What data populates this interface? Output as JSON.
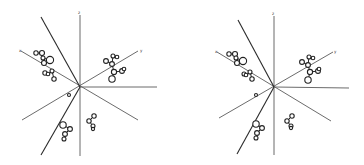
{
  "figure": {
    "type": "stereo-pair",
    "panels": [
      {
        "id": "left",
        "offset_x": 0,
        "center": [
          80,
          87
        ],
        "axes": [
          {
            "name": "z",
            "from": [
              80,
              87
            ],
            "to": [
              80,
              15
            ],
            "label_at": [
              78,
              14
            ]
          },
          {
            "name": "z-neg",
            "from": [
              80,
              87
            ],
            "to": [
              80,
              156
            ]
          },
          {
            "name": "x",
            "from": [
              21,
              51
            ],
            "to": [
              138,
              120
            ],
            "label_at": [
              19,
              52
            ]
          },
          {
            "name": "y",
            "from": [
              138,
              51
            ],
            "to": [
              22,
              120
            ],
            "label_at": [
              140,
              52
            ]
          },
          {
            "name": "steep-a",
            "from": [
              41,
              17
            ],
            "to": [
              80,
              87
            ]
          },
          {
            "name": "steep-b",
            "from": [
              80,
              87
            ],
            "to": [
              41,
              155
            ]
          },
          {
            "name": "horizontal",
            "from": [
              80,
              87
            ],
            "to": [
              157,
              87
            ]
          }
        ],
        "label_glyphs": {
          "top": "z",
          "left": "x",
          "right": "y"
        },
        "molecules": [
          {
            "atoms": [
              [
                36,
                53,
                2.2
              ],
              [
                42,
                53,
                2.5
              ],
              [
                50,
                60,
                3.6
              ],
              [
                44,
                63,
                2.5
              ],
              [
                43,
                58,
                2
              ]
            ],
            "bonds": [
              [
                0,
                1
              ],
              [
                1,
                4
              ],
              [
                4,
                3
              ],
              [
                4,
                2
              ]
            ]
          },
          {
            "atoms": [
              [
                45,
                73,
                2.2
              ],
              [
                52,
                71,
                2
              ],
              [
                54,
                79,
                2.2
              ],
              [
                48,
                74,
                1.8
              ]
            ],
            "bonds": [
              [
                0,
                3
              ],
              [
                3,
                1
              ],
              [
                1,
                2
              ]
            ]
          },
          {
            "atoms": [
              [
                106,
                61,
                2.4
              ],
              [
                113,
                56,
                2
              ],
              [
                117,
                57,
                1.8
              ],
              [
                112,
                64,
                2.4
              ],
              [
                114,
                72,
                2.6
              ],
              [
                122,
                71,
                2.4
              ],
              [
                124,
                69,
                1.8
              ],
              [
                112,
                79,
                3.2
              ]
            ],
            "bonds": [
              [
                0,
                3
              ],
              [
                3,
                1
              ],
              [
                1,
                2
              ],
              [
                3,
                4
              ],
              [
                4,
                5
              ],
              [
                5,
                6
              ],
              [
                4,
                7
              ]
            ]
          },
          {
            "atoms": [
              [
                63,
                125,
                3.2
              ],
              [
                70,
                129,
                2.4
              ],
              [
                65,
                134,
                2.4
              ],
              [
                64,
                139,
                2
              ]
            ],
            "bonds": [
              [
                0,
                1
              ],
              [
                1,
                2
              ],
              [
                2,
                3
              ]
            ]
          },
          {
            "atoms": [
              [
                94,
                116,
                2.2
              ],
              [
                89,
                121,
                2.2
              ],
              [
                93,
                126,
                2
              ],
              [
                93,
                129,
                1.6
              ]
            ],
            "bonds": [
              [
                0,
                1
              ],
              [
                1,
                2
              ],
              [
                2,
                3
              ]
            ]
          },
          {
            "atoms": [
              [
                69,
                95,
                1.5
              ]
            ],
            "bonds": []
          }
        ]
      },
      {
        "id": "right",
        "offset_x": 182,
        "center": [
          92,
          87
        ],
        "axes": [
          {
            "name": "z",
            "from": [
              92,
              87
            ],
            "to": [
              92,
              16
            ],
            "label_at": [
              90,
              15
            ]
          },
          {
            "name": "z-neg",
            "from": [
              92,
              87
            ],
            "to": [
              92,
              155
            ]
          },
          {
            "name": "x",
            "from": [
              35,
              52
            ],
            "to": [
              149,
              121
            ],
            "label_at": [
              33,
              53
            ]
          },
          {
            "name": "y",
            "from": [
              151,
              52
            ],
            "to": [
              37,
              118
            ],
            "label_at": [
              152,
              53
            ]
          },
          {
            "name": "steep-a",
            "from": [
              56,
              20
            ],
            "to": [
              92,
              87
            ]
          },
          {
            "name": "steep-b",
            "from": [
              92,
              87
            ],
            "to": [
              55,
              154
            ]
          },
          {
            "name": "horizontal",
            "from": [
              92,
              87
            ],
            "to": [
              167,
              88
            ]
          }
        ],
        "label_glyphs": {
          "top": "z",
          "left": "x",
          "right": "y"
        },
        "molecules": [
          {
            "atoms": [
              [
                47,
                54,
                2.2
              ],
              [
                53,
                54,
                2.5
              ],
              [
                61,
                61,
                3.6
              ],
              [
                55,
                63,
                2.5
              ],
              [
                54,
                58,
                2
              ]
            ],
            "bonds": [
              [
                0,
                1
              ],
              [
                1,
                4
              ],
              [
                4,
                3
              ],
              [
                4,
                2
              ]
            ]
          },
          {
            "atoms": [
              [
                62,
                74,
                2
              ],
              [
                68,
                72,
                2
              ],
              [
                70,
                79,
                2.2
              ],
              [
                64,
                75,
                1.8
              ]
            ],
            "bonds": [
              [
                0,
                3
              ],
              [
                3,
                1
              ],
              [
                1,
                2
              ]
            ]
          },
          {
            "atoms": [
              [
                120,
                62,
                2.4
              ],
              [
                127,
                57,
                2
              ],
              [
                131,
                58,
                1.8
              ],
              [
                126,
                65,
                2.4
              ],
              [
                128,
                72,
                2.6
              ],
              [
                136,
                71,
                2.4
              ],
              [
                137,
                69,
                1.8
              ],
              [
                126,
                80,
                3.2
              ]
            ],
            "bonds": [
              [
                0,
                3
              ],
              [
                3,
                1
              ],
              [
                1,
                2
              ],
              [
                3,
                4
              ],
              [
                4,
                5
              ],
              [
                5,
                6
              ],
              [
                4,
                7
              ]
            ]
          },
          {
            "atoms": [
              [
                74,
                124,
                3.2
              ],
              [
                80,
                128,
                2.4
              ],
              [
                75,
                133,
                2.4
              ],
              [
                74,
                138,
                2
              ]
            ],
            "bonds": [
              [
                0,
                1
              ],
              [
                1,
                2
              ],
              [
                2,
                3
              ]
            ]
          },
          {
            "atoms": [
              [
                110,
                116,
                2.2
              ],
              [
                105,
                121,
                2.2
              ],
              [
                109,
                126,
                2
              ],
              [
                109,
                128,
                1.6
              ]
            ],
            "bonds": [
              [
                0,
                1
              ],
              [
                1,
                2
              ],
              [
                2,
                3
              ]
            ]
          },
          {
            "atoms": [
              [
                74,
                95,
                1.5
              ]
            ],
            "bonds": []
          }
        ]
      }
    ]
  }
}
